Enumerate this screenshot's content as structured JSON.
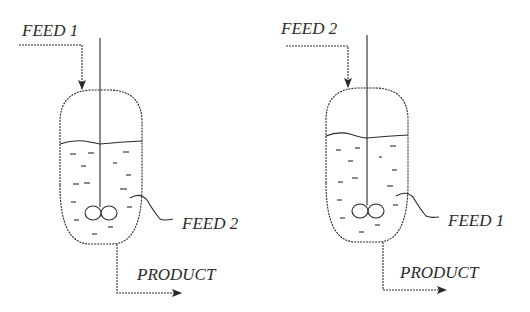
{
  "diagram": {
    "title": "",
    "reactors": [
      {
        "id": "reactor-a",
        "top_feed_label": "FEED 1",
        "side_feed_label": "FEED 2",
        "product_label": "PRODUCT"
      },
      {
        "id": "reactor-b",
        "top_feed_label": "FEED 2",
        "side_feed_label": "FEED 1",
        "product_label": "PRODUCT"
      }
    ],
    "colors": {
      "stroke": "#2a2a2a",
      "background": "#ffffff"
    },
    "icons": {
      "impeller": "twin-blade-impeller",
      "arrow": "flow-arrow"
    }
  }
}
